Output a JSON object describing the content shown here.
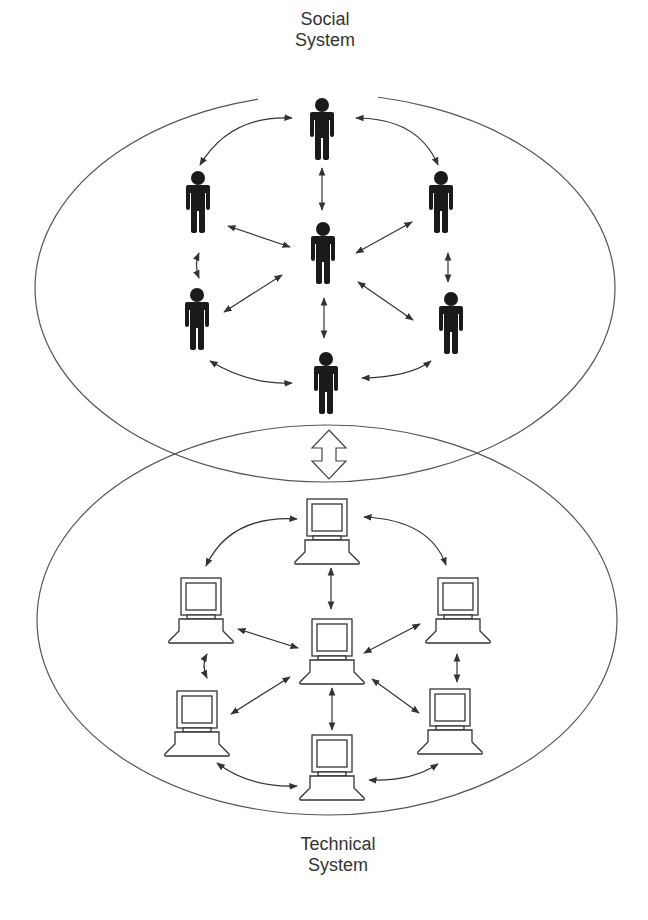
{
  "labels": {
    "social": [
      "Social",
      "System"
    ],
    "technical": [
      "Technical",
      "System"
    ]
  },
  "colors": {
    "ellipse_stroke": "#555555",
    "arrow": "#333333",
    "person_fill": "#1a1a1a",
    "computer_stroke": "#333333",
    "background": "#ffffff"
  },
  "systems": {
    "social": {
      "ellipse": {
        "cx": 325,
        "cy": 288,
        "rx": 290,
        "ry": 194
      },
      "nodes": [
        {
          "id": "top",
          "x": 322,
          "y": 105
        },
        {
          "id": "left-upper",
          "x": 198,
          "y": 178
        },
        {
          "id": "right-upper",
          "x": 441,
          "y": 178
        },
        {
          "id": "center",
          "x": 323,
          "y": 229
        },
        {
          "id": "left-lower",
          "x": 197,
          "y": 295
        },
        {
          "id": "right-lower",
          "x": 451,
          "y": 299
        },
        {
          "id": "bottom",
          "x": 326,
          "y": 359
        }
      ]
    },
    "technical": {
      "ellipse": {
        "cx": 327,
        "cy": 620,
        "rx": 290,
        "ry": 195
      },
      "nodes": [
        {
          "id": "top",
          "x": 327,
          "y": 499
        },
        {
          "id": "left-upper",
          "x": 201,
          "y": 578
        },
        {
          "id": "right-upper",
          "x": 458,
          "y": 578
        },
        {
          "id": "center",
          "x": 332,
          "y": 619
        },
        {
          "id": "left-lower",
          "x": 197,
          "y": 691
        },
        {
          "id": "right-lower",
          "x": 450,
          "y": 689
        },
        {
          "id": "bottom",
          "x": 332,
          "y": 735
        }
      ]
    }
  },
  "interaction_arrow": {
    "type": "double-headed hollow",
    "between": [
      "Social System",
      "Technical System"
    ]
  }
}
